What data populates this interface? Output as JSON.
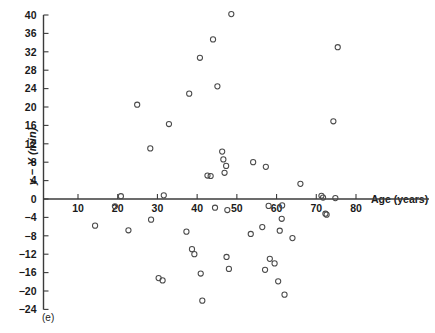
{
  "figure": {
    "panel_tag": "(e)",
    "background": "#ffffff",
    "marker_color": "#4a4a4a",
    "axis_color": "#3b3b3b"
  },
  "axes": {
    "ylabel_main": "y − Y",
    "ylabel_units": "(min)",
    "ylabel_full": "y − Y (min)",
    "xlabel": "Age (years)",
    "y_ticks": [
      40,
      36,
      32,
      28,
      24,
      20,
      16,
      12,
      8,
      4,
      0,
      -4,
      -8,
      -12,
      -16,
      -20,
      -24
    ],
    "x_ticks": [
      10,
      20,
      30,
      40,
      50,
      60,
      70,
      80
    ]
  },
  "chart_data": {
    "type": "scatter",
    "title": "",
    "xlabel": "Age (years)",
    "ylabel": "y − Y (min)",
    "xlim": [
      5,
      87
    ],
    "ylim": [
      -24,
      41
    ],
    "grid": false,
    "legend": "none",
    "annotations": [
      "(e)"
    ],
    "marker": "open-circle",
    "series": [
      {
        "name": "residuals",
        "points": [
          [
            14.3,
            -5.8
          ],
          [
            19.3,
            -1.6
          ],
          [
            20.8,
            0.6
          ],
          [
            22.7,
            -6.8
          ],
          [
            24.9,
            20.5
          ],
          [
            28.2,
            11.0
          ],
          [
            28.4,
            -4.5
          ],
          [
            30.3,
            -17.2
          ],
          [
            31.3,
            -17.7
          ],
          [
            31.6,
            0.8
          ],
          [
            32.9,
            16.3
          ],
          [
            37.3,
            -7.1
          ],
          [
            38.0,
            22.9
          ],
          [
            38.7,
            -10.9
          ],
          [
            39.3,
            -12.0
          ],
          [
            40.7,
            30.7
          ],
          [
            40.9,
            -16.2
          ],
          [
            41.3,
            -22.1
          ],
          [
            42.6,
            5.1
          ],
          [
            43.4,
            5.0
          ],
          [
            44.0,
            34.7
          ],
          [
            44.5,
            -1.9
          ],
          [
            45.1,
            24.5
          ],
          [
            46.3,
            10.3
          ],
          [
            46.6,
            8.6
          ],
          [
            46.9,
            5.7
          ],
          [
            47.3,
            7.2
          ],
          [
            47.4,
            -12.6
          ],
          [
            47.6,
            -2.4
          ],
          [
            48.0,
            -15.2
          ],
          [
            48.6,
            40.2
          ],
          [
            53.5,
            -7.6
          ],
          [
            54.1,
            8.0
          ],
          [
            56.4,
            -6.1
          ],
          [
            57.1,
            -15.4
          ],
          [
            57.3,
            7.0
          ],
          [
            58.0,
            -1.5
          ],
          [
            58.3,
            -13.0
          ],
          [
            59.5,
            -14.0
          ],
          [
            60.4,
            -17.9
          ],
          [
            60.8,
            -6.9
          ],
          [
            61.3,
            -4.3
          ],
          [
            61.4,
            -1.4
          ],
          [
            62.0,
            -20.8
          ],
          [
            64.0,
            -8.5
          ],
          [
            66.0,
            3.3
          ],
          [
            71.3,
            0.7
          ],
          [
            71.7,
            0.3
          ],
          [
            72.3,
            -3.2
          ],
          [
            72.6,
            -3.4
          ],
          [
            74.3,
            16.9
          ],
          [
            74.8,
            0.2
          ],
          [
            75.4,
            33.0
          ]
        ]
      }
    ]
  }
}
